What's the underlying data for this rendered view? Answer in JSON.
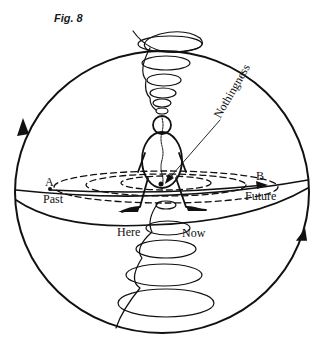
{
  "figure": {
    "caption": "Fig. 8",
    "labels": {
      "point_a": "A",
      "point_b": "B",
      "past": "Past",
      "future": "Future",
      "here": "Here",
      "now": "Now",
      "nothingness": "Nothingness"
    },
    "colors": {
      "stroke": "#111111",
      "background": "#ffffff"
    },
    "elements": [
      "sphere-outline",
      "equator-band",
      "dashed-concentric-ellipses",
      "upper-spiral",
      "lower-spiral",
      "human-figure",
      "timeline-arrow-a-to-b",
      "sphere-rotation-arrows",
      "nothingness-pointer"
    ]
  }
}
